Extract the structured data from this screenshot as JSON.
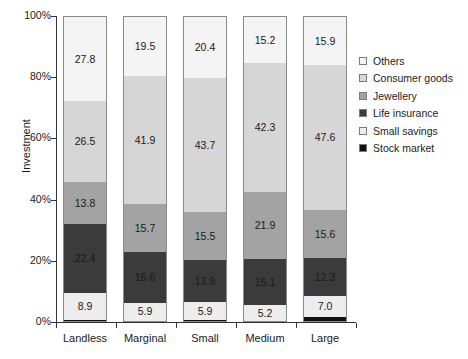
{
  "chart_data": {
    "type": "bar",
    "stacked": true,
    "stack_mode": "percent",
    "title": "",
    "xlabel": "",
    "ylabel": "Investment",
    "ylim": [
      0,
      100
    ],
    "ytick_labels": [
      "0%",
      "20%",
      "40%",
      "60%",
      "80%",
      "100%"
    ],
    "ytick_values": [
      0,
      20,
      40,
      60,
      80,
      100
    ],
    "grid": false,
    "legend_position": "right",
    "categories": [
      "Landless",
      "Marginal",
      "Small",
      "Medium",
      "Large"
    ],
    "series": [
      {
        "name": "Others",
        "color": "#f4f4f4",
        "values": [
          27.8,
          19.5,
          20.4,
          15.2,
          15.9
        ],
        "labels": [
          "27.8",
          "19.5",
          "20.4",
          "15.2",
          "15.9"
        ]
      },
      {
        "name": "Consumer goods",
        "color": "#d6d6d6",
        "values": [
          26.5,
          41.9,
          43.7,
          42.3,
          47.6
        ],
        "labels": [
          "26.5",
          "41.9",
          "43.7",
          "42.3",
          "47.6"
        ]
      },
      {
        "name": "Jewellery",
        "color": "#a3a3a3",
        "values": [
          13.8,
          15.7,
          15.5,
          21.9,
          15.6
        ],
        "labels": [
          "13.8",
          "15.7",
          "15.5",
          "21.9",
          "15.6"
        ]
      },
      {
        "name": "Life insurance",
        "color": "#3b3b3b",
        "values": [
          22.4,
          16.6,
          13.9,
          15.1,
          12.3
        ],
        "labels": [
          "22.4",
          "16.6",
          "13.9",
          "15.1",
          "12.3"
        ]
      },
      {
        "name": "Small savings",
        "color": "#ededed",
        "values": [
          8.9,
          5.9,
          5.9,
          5.2,
          7.0
        ],
        "labels": [
          "8.9",
          "5.9",
          "5.9",
          "5.2",
          "7.0"
        ]
      },
      {
        "name": "Stock market",
        "color": "#111111",
        "values": [
          0.6,
          0.4,
          0.6,
          0.3,
          1.6
        ],
        "labels": [
          "",
          "",
          "",
          "",
          ""
        ]
      }
    ]
  }
}
